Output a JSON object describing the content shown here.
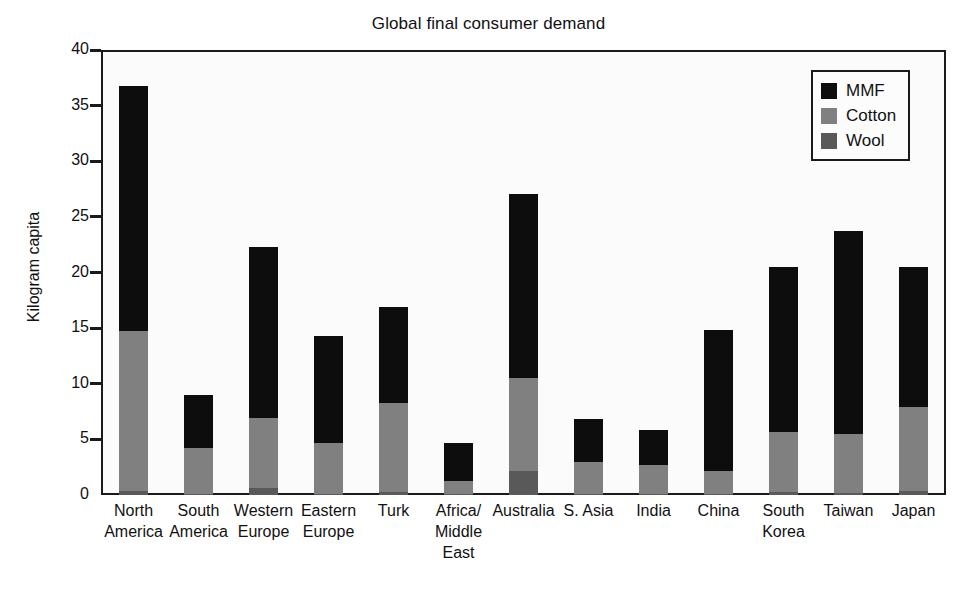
{
  "chart_data": {
    "type": "bar",
    "subtype": "stacked-vertical",
    "title": "Global final consumer demand",
    "xlabel": "",
    "ylabel": "Kilogram capita",
    "ylim": [
      0,
      40
    ],
    "yticks": [
      0,
      5,
      10,
      15,
      20,
      25,
      30,
      35,
      40
    ],
    "ytick_labels": [
      "0",
      "5",
      "10",
      "15",
      "20",
      "25",
      "30",
      "35",
      "40"
    ],
    "grid": false,
    "legend_position": "top-right",
    "categories": [
      "North America",
      "South America",
      "Western Europe",
      "Eastern Europe",
      "Turk",
      "Africa/ Middle East",
      "Australia",
      "S. Asia",
      "India",
      "China",
      "South Korea",
      "Taiwan",
      "Japan"
    ],
    "category_label_lines": [
      [
        "North",
        "America"
      ],
      [
        "South",
        "America"
      ],
      [
        "Western",
        "Europe"
      ],
      [
        "Eastern",
        "Europe"
      ],
      [
        "Turk"
      ],
      [
        "Africa/",
        "Middle",
        "East"
      ],
      [
        "Australia"
      ],
      [
        "S. Asia"
      ],
      [
        "India"
      ],
      [
        "China"
      ],
      [
        "South",
        "Korea"
      ],
      [
        "Taiwan"
      ],
      [
        "Japan"
      ]
    ],
    "series": [
      {
        "name": "Wool",
        "color": "#595959",
        "values": [
          0.4,
          0.1,
          0.6,
          0.1,
          0.3,
          0.05,
          2.2,
          0.1,
          0.1,
          0.1,
          0.3,
          0.2,
          0.4
        ]
      },
      {
        "name": "Cotton",
        "color": "#808080",
        "values": [
          14.3,
          4.1,
          6.3,
          4.6,
          8.0,
          1.25,
          8.3,
          2.9,
          2.6,
          2.1,
          5.4,
          5.3,
          7.5
        ]
      },
      {
        "name": "MMF",
        "color": "#0d0d0d",
        "values": [
          22.1,
          4.8,
          15.4,
          9.6,
          8.6,
          3.4,
          16.6,
          3.8,
          3.1,
          12.6,
          14.8,
          18.2,
          12.6
        ]
      }
    ],
    "stack_tops": {
      "wool": [
        0.4,
        0.1,
        0.6,
        0.1,
        0.3,
        0.05,
        2.2,
        0.1,
        0.1,
        0.1,
        0.3,
        0.2,
        0.4
      ],
      "cotton": [
        14.7,
        4.2,
        6.9,
        4.7,
        8.3,
        1.3,
        10.5,
        3.0,
        2.7,
        2.2,
        5.7,
        5.5,
        7.9
      ],
      "total": [
        36.8,
        9.0,
        22.3,
        14.3,
        16.9,
        4.7,
        27.1,
        6.8,
        5.8,
        14.8,
        20.5,
        23.7,
        20.5
      ]
    },
    "totals": [
      36.8,
      9.0,
      22.3,
      14.3,
      16.9,
      4.7,
      27.1,
      6.8,
      5.8,
      14.8,
      20.5,
      23.7,
      20.5
    ]
  },
  "legend": {
    "items": [
      {
        "label": "MMF",
        "color": "#0d0d0d",
        "swatch": "mmf-swatch"
      },
      {
        "label": "Cotton",
        "color": "#808080",
        "swatch": "cotton-swatch"
      },
      {
        "label": "Wool",
        "color": "#595959",
        "swatch": "wool-swatch"
      }
    ]
  }
}
